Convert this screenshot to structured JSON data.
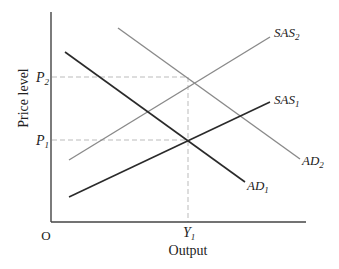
{
  "diagram": {
    "type": "AD-AS model",
    "axes": {
      "y_label": "Price level",
      "x_label": "Output",
      "origin_label": "O"
    },
    "ticks": {
      "p2": {
        "base": "P",
        "sub": "2"
      },
      "p1": {
        "base": "P",
        "sub": "1"
      },
      "y1": {
        "base": "Y",
        "sub": "1"
      }
    },
    "curves": [
      {
        "id": "SAS2",
        "base": "SAS",
        "sub": "2",
        "color": "#8a8a8a"
      },
      {
        "id": "SAS1",
        "base": "SAS",
        "sub": "1",
        "color": "#2a2a2a"
      },
      {
        "id": "AD2",
        "base": "AD",
        "sub": "2",
        "color": "#8a8a8a"
      },
      {
        "id": "AD1",
        "base": "AD",
        "sub": "1",
        "color": "#2a2a2a"
      }
    ]
  }
}
